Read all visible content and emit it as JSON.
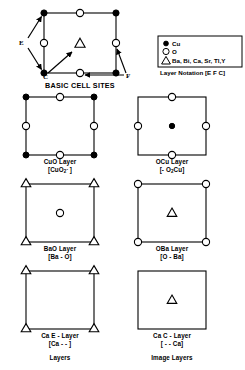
{
  "figure": {
    "main_title": "BASIC CELL SITES",
    "columns": {
      "left_caption": "Layers",
      "right_caption": "Image Layers"
    }
  },
  "legend": {
    "entries": [
      {
        "symbol": "filled-circle",
        "label": "Cu"
      },
      {
        "symbol": "open-circle",
        "label": "O"
      },
      {
        "symbol": "triangle",
        "label": "Ba, Bi, Ca, Sr, Tl,Y"
      }
    ],
    "notation_label": "Layer Notation  [E F C]"
  },
  "basic_cell": {
    "annotations": [
      {
        "name": "E",
        "text": "E"
      },
      {
        "name": "C",
        "text": "C"
      },
      {
        "name": "F",
        "text": "F"
      }
    ],
    "sites": {
      "corners": "Cu",
      "edge_midpoints": "O",
      "center": "Ba, Bi, Ca, Sr, Tl, Y"
    }
  },
  "layers": [
    {
      "id": "cuo-layer",
      "name": "CuO Layer",
      "formula_pre": "[CuO",
      "formula_sub": "2",
      "formula_sup": "-",
      "formula_post": " ]",
      "formula_plain": "[CuO2- ]",
      "corner_symbol": "filled-circle",
      "edge_symbol": "open-circle",
      "center_symbol": "none",
      "column": "left"
    },
    {
      "id": "ocu-layer",
      "name": "OCu Layer",
      "formula_pre": "[- O",
      "formula_sub": "2",
      "formula_sup": "",
      "formula_post": "Cu]",
      "formula_plain": "[- O2Cu]",
      "corner_symbol": "none",
      "edge_symbol": "open-circle",
      "center_symbol": "filled-circle",
      "column": "right"
    },
    {
      "id": "bao-layer",
      "name": "BaO Layer",
      "formula_pre": "[Ba - O]",
      "formula_sub": "",
      "formula_sup": "",
      "formula_post": "",
      "formula_plain": "[Ba - O]",
      "corner_symbol": "triangle",
      "edge_symbol": "none",
      "center_symbol": "open-circle",
      "column": "left"
    },
    {
      "id": "oba-layer",
      "name": "OBa Layer",
      "formula_pre": "[O - Ba]",
      "formula_sub": "",
      "formula_sup": "",
      "formula_post": "",
      "formula_plain": "[O - Ba]",
      "corner_symbol": "open-circle",
      "edge_symbol": "none",
      "center_symbol": "triangle",
      "column": "right"
    },
    {
      "id": "ca-e-layer",
      "name": "Ca  E - Layer",
      "formula_pre": "[Ca - - ]",
      "formula_sub": "",
      "formula_sup": "",
      "formula_post": "",
      "formula_plain": "[Ca - - ]",
      "corner_symbol": "triangle",
      "edge_symbol": "none",
      "center_symbol": "none",
      "column": "left"
    },
    {
      "id": "ca-c-layer",
      "name": "Ca  C - Layer",
      "formula_pre": "[ - - Ca]",
      "formula_sub": "",
      "formula_sup": "",
      "formula_post": "",
      "formula_plain": "[ - - Ca]",
      "corner_symbol": "none",
      "edge_symbol": "none",
      "center_symbol": "triangle",
      "column": "right"
    }
  ],
  "colors": {
    "stroke": "#000000",
    "fill_open": "#ffffff",
    "fill_solid": "#000000",
    "background": "#ffffff"
  }
}
